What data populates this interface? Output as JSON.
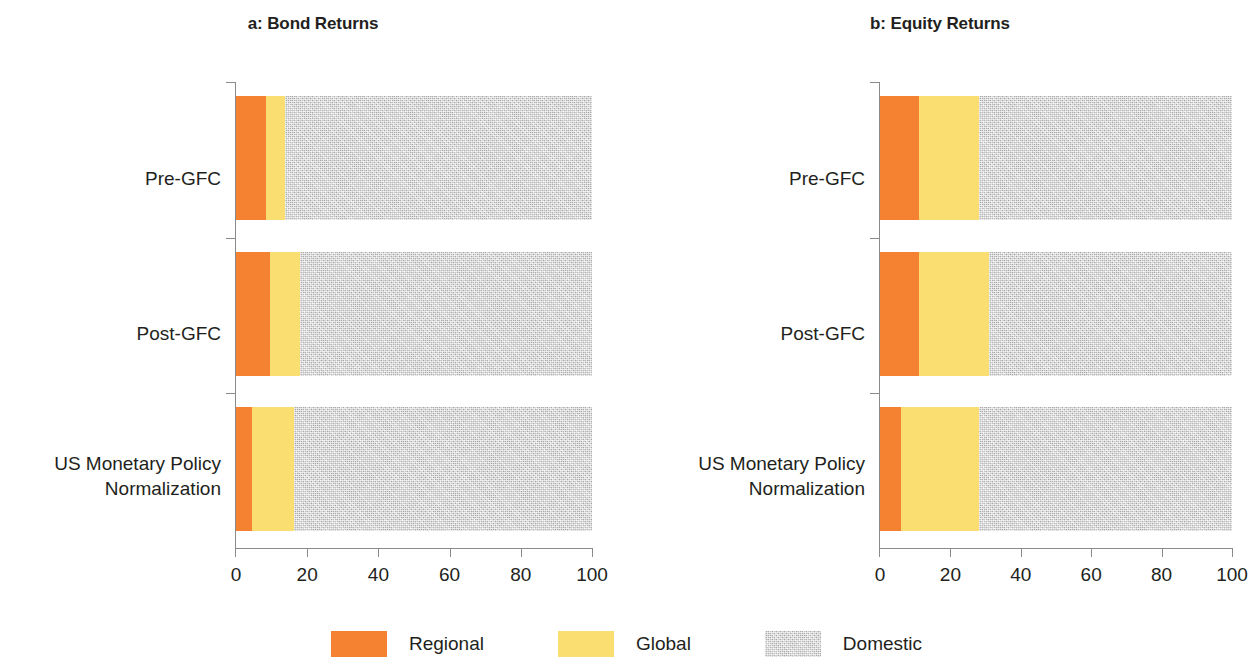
{
  "colors": {
    "regional": "#F58230",
    "global": "#FADE72",
    "domestic": "#D5D5D5",
    "axis": "#8A8A8A",
    "text": "#231F20"
  },
  "legend": {
    "items": [
      {
        "key": "regional",
        "label": "Regional",
        "color": "#F58230"
      },
      {
        "key": "global",
        "label": "Global",
        "color": "#FADE72"
      },
      {
        "key": "domestic",
        "label": "Domestic",
        "color": "#D5D5D5"
      }
    ]
  },
  "panels": [
    {
      "id": "bond",
      "title": "a: Bond Returns"
    },
    {
      "id": "equity",
      "title": "b: Equity Returns"
    }
  ],
  "axis": {
    "ticks": [
      "0",
      "20",
      "40",
      "60",
      "80",
      "100"
    ],
    "min": 0,
    "max": 100
  },
  "categories": [
    {
      "label": "Pre-GFC"
    },
    {
      "label": "Post-GFC"
    },
    {
      "label": "US Monetary Policy\nNormalization"
    }
  ],
  "chart_data": [
    {
      "type": "bar",
      "orientation": "horizontal",
      "stacked": true,
      "stack_mode": "percent",
      "title": "a: Bond Returns",
      "xlabel": "",
      "ylabel": "",
      "xlim": [
        0,
        100
      ],
      "xticks": [
        0,
        20,
        40,
        60,
        80,
        100
      ],
      "grid": false,
      "legend_position": "bottom-center",
      "categories": [
        "Pre-GFC",
        "Post-GFC",
        "US Monetary Policy Normalization"
      ],
      "series": [
        {
          "name": "Regional",
          "color": "#F58230",
          "values": [
            8.4,
            9.5,
            4.5
          ]
        },
        {
          "name": "Global",
          "color": "#FADE72",
          "values": [
            5.3,
            8.5,
            11.8
          ]
        },
        {
          "name": "Domestic",
          "color": "#D5D5D5",
          "values": [
            86.3,
            82.0,
            83.7
          ]
        }
      ]
    },
    {
      "type": "bar",
      "orientation": "horizontal",
      "stacked": true,
      "stack_mode": "percent",
      "title": "b: Equity Returns",
      "xlabel": "",
      "ylabel": "",
      "xlim": [
        0,
        100
      ],
      "xticks": [
        0,
        20,
        40,
        60,
        80,
        100
      ],
      "grid": false,
      "legend_position": "bottom-center",
      "categories": [
        "Pre-GFC",
        "Post-GFC",
        "US Monetary Policy Normalization"
      ],
      "series": [
        {
          "name": "Regional",
          "color": "#F58230",
          "values": [
            11.0,
            11.0,
            6.0
          ]
        },
        {
          "name": "Global",
          "color": "#FADE72",
          "values": [
            17.0,
            20.0,
            22.0
          ]
        },
        {
          "name": "Domestic",
          "color": "#D5D5D5",
          "values": [
            72.0,
            69.0,
            72.0
          ]
        }
      ]
    }
  ]
}
